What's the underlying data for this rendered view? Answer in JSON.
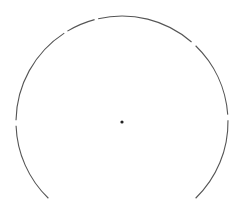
{
  "figure": {
    "width": 248,
    "height": 211,
    "background": "#ffffff",
    "stroke_color": "#555555",
    "dot_color": "#222222",
    "center": [
      122,
      122
    ],
    "radius": 106,
    "dot_radius": 1.6,
    "arc_segments": [
      {
        "start_deg": 134,
        "end_deg": 178
      },
      {
        "start_deg": 181,
        "end_deg": 237
      },
      {
        "start_deg": 239,
        "end_deg": 255
      },
      {
        "start_deg": 257,
        "end_deg": 311
      },
      {
        "start_deg": 314,
        "end_deg": 356
      },
      {
        "start_deg": 359,
        "end_deg": 406
      }
    ]
  }
}
